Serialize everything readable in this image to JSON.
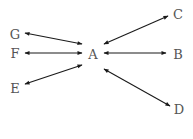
{
  "diagram": {
    "type": "star",
    "hub": "A",
    "colors": {
      "edge": "#1a1a1a",
      "label": "#555555",
      "background": "#ffffff"
    },
    "nodes": [
      {
        "id": "A",
        "label": "A",
        "x": 93,
        "y": 54
      },
      {
        "id": "B",
        "label": "B",
        "x": 178,
        "y": 54
      },
      {
        "id": "C",
        "label": "C",
        "x": 178,
        "y": 14
      },
      {
        "id": "D",
        "label": "D",
        "x": 179,
        "y": 109
      },
      {
        "id": "E",
        "label": "E",
        "x": 15,
        "y": 88
      },
      {
        "id": "F",
        "label": "F",
        "x": 15,
        "y": 53
      },
      {
        "id": "G",
        "label": "G",
        "x": 15,
        "y": 34
      }
    ],
    "edges": [
      {
        "from": "A",
        "to": "C",
        "direction": "both",
        "x1": 104,
        "y1": 44,
        "x2": 168,
        "y2": 16
      },
      {
        "from": "A",
        "to": "B",
        "direction": "both",
        "x1": 104,
        "y1": 53,
        "x2": 166,
        "y2": 53
      },
      {
        "from": "A",
        "to": "D",
        "direction": "both",
        "x1": 104,
        "y1": 69,
        "x2": 170,
        "y2": 106
      },
      {
        "from": "A",
        "to": "G",
        "direction": "both",
        "x1": 82,
        "y1": 44,
        "x2": 25,
        "y2": 33
      },
      {
        "from": "A",
        "to": "F",
        "direction": "both",
        "x1": 82,
        "y1": 53,
        "x2": 25,
        "y2": 53
      },
      {
        "from": "A",
        "to": "E",
        "direction": "both",
        "x1": 82,
        "y1": 65,
        "x2": 25,
        "y2": 84
      }
    ]
  }
}
